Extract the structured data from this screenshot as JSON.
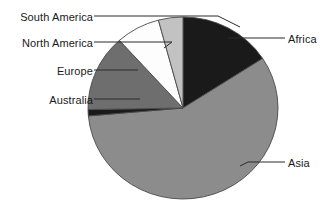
{
  "chart_data": {
    "type": "pie",
    "title": "",
    "subtitle": "",
    "xlabel": "",
    "ylabel": "",
    "grid": false,
    "legend_position": "callout-labels",
    "start_angle_deg": 0,
    "direction": "clockwise",
    "categories": [
      "Africa",
      "Asia",
      "Australia",
      "Europe",
      "North America",
      "South America"
    ],
    "values": [
      15.8,
      57.8,
      1.1,
      13.6,
      7.5,
      4.2
    ],
    "units": "percent",
    "slices": [
      {
        "label": "Africa",
        "value": 15.8,
        "start_deg": 0,
        "end_deg": 57,
        "color": "#1a1a1a",
        "label_side": "right"
      },
      {
        "label": "Asia",
        "value": 57.8,
        "start_deg": 57,
        "end_deg": 265,
        "color": "#8c8c8c",
        "label_side": "right"
      },
      {
        "label": "Australia",
        "value": 1.1,
        "start_deg": 265,
        "end_deg": 269,
        "color": "#1a1a1a",
        "label_side": "left"
      },
      {
        "label": "Europe",
        "value": 13.6,
        "start_deg": 269,
        "end_deg": 318,
        "color": "#6e6e6e",
        "label_side": "left"
      },
      {
        "label": "North America",
        "value": 7.5,
        "start_deg": 318,
        "end_deg": 345,
        "color": "#fdfdfd",
        "label_side": "left"
      },
      {
        "label": "South America",
        "value": 4.2,
        "start_deg": 345,
        "end_deg": 360,
        "color": "#c2c2c2",
        "label_side": "left"
      }
    ]
  },
  "labels": {
    "south_america": "South America",
    "north_america": "North America",
    "europe": "Europe",
    "australia": "Australia",
    "africa": "Africa",
    "asia": "Asia"
  },
  "colors": {
    "africa": "#1a1a1a",
    "asia": "#8c8c8c",
    "australia": "#1a1a1a",
    "europe": "#6e6e6e",
    "north_america": "#fdfdfd",
    "south_america": "#c2c2c2",
    "outline": "#4a4a4a",
    "leader_line": "#2b2b2b",
    "text": "#1a1a1a",
    "background": "#ffffff"
  }
}
